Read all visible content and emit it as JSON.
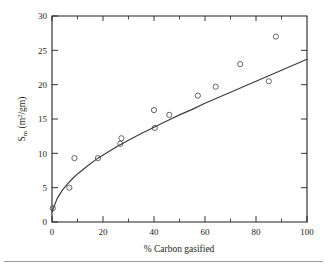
{
  "chart_data": {
    "type": "scatter",
    "title": "",
    "xlabel": "% Carbon gasified",
    "ylabel": "S_m (m2/gm)",
    "ylabel_parts": {
      "main": "S",
      "subscript": "m",
      "unit_open": " (m",
      "unit_sup": "2",
      "unit_close": "/gm)"
    },
    "xlim": [
      0,
      100
    ],
    "ylim": [
      0,
      30
    ],
    "xticks": [
      0,
      20,
      40,
      60,
      80,
      100
    ],
    "yticks": [
      0,
      5,
      10,
      15,
      20,
      25,
      30
    ],
    "xtick_labels": [
      "0",
      "20",
      "40",
      "60",
      "80",
      "100"
    ],
    "ytick_labels": [
      "0",
      "5",
      "10",
      "15",
      "20",
      "25",
      "30"
    ],
    "x_minor_ticks": [
      10,
      30,
      50,
      70,
      90
    ],
    "y_minor_ticks": [
      2.5,
      7.5,
      12.5,
      17.5,
      22.5,
      27.5
    ],
    "grid": false,
    "legend": null,
    "marker_style": "open-circle",
    "points": [
      {
        "x": 0.3,
        "y": 2.0
      },
      {
        "x": 6.8,
        "y": 5.0
      },
      {
        "x": 8.8,
        "y": 9.3
      },
      {
        "x": 18.0,
        "y": 9.3
      },
      {
        "x": 26.8,
        "y": 11.4
      },
      {
        "x": 27.2,
        "y": 12.2
      },
      {
        "x": 40.0,
        "y": 16.3
      },
      {
        "x": 40.3,
        "y": 13.7
      },
      {
        "x": 46.0,
        "y": 15.6
      },
      {
        "x": 57.2,
        "y": 18.4
      },
      {
        "x": 64.2,
        "y": 19.7
      },
      {
        "x": 73.8,
        "y": 23.0
      },
      {
        "x": 85.0,
        "y": 20.5
      },
      {
        "x": 87.8,
        "y": 27.0
      }
    ],
    "fit_curve": {
      "description": "monotonic power-law fit through the data",
      "x": [
        0,
        2,
        4,
        6,
        8,
        10,
        14,
        18,
        22,
        26,
        30,
        35,
        40,
        45,
        50,
        55,
        60,
        65,
        70,
        75,
        80,
        85,
        90,
        95,
        100
      ],
      "y": [
        1.5,
        3.4,
        4.6,
        5.5,
        6.3,
        7.0,
        8.2,
        9.3,
        10.2,
        11.1,
        11.9,
        12.9,
        13.8,
        14.7,
        15.6,
        16.4,
        17.3,
        18.1,
        18.9,
        19.7,
        20.5,
        21.3,
        22.1,
        22.9,
        23.7
      ]
    }
  },
  "figure": {
    "background_color": "#ffffff",
    "axis_color": "#231f20",
    "curve_color": "#3a3a3a",
    "marker_color": "#4a4a4a"
  }
}
